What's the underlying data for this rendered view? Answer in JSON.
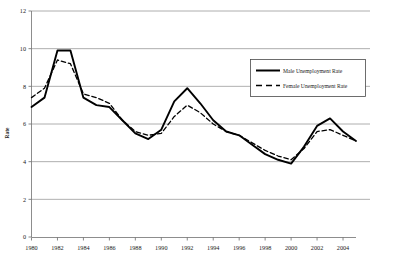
{
  "chart_data": {
    "type": "line",
    "title": "",
    "xlabel": "",
    "ylabel": "Rate",
    "xlim": [
      1980,
      2005
    ],
    "ylim": [
      0,
      12
    ],
    "ytick_step": 2,
    "xtick_step": 2,
    "grid": true,
    "grid_axis": "y",
    "legend_position": "upper-right",
    "x": [
      1980,
      1981,
      1982,
      1983,
      1984,
      1985,
      1986,
      1987,
      1988,
      1989,
      1990,
      1991,
      1992,
      1993,
      1994,
      1995,
      1996,
      1997,
      1998,
      1999,
      2000,
      2001,
      2002,
      2003,
      2004,
      2005
    ],
    "yticks": [
      0,
      2,
      4,
      6,
      8,
      10,
      12
    ],
    "ytick_labels": [
      "0",
      "2",
      "4",
      "6",
      "8",
      "10",
      "12"
    ],
    "xticks": [
      1980,
      1982,
      1984,
      1986,
      1988,
      1990,
      1992,
      1994,
      1996,
      1998,
      2000,
      2002,
      2004
    ],
    "xtick_labels": [
      "1980",
      "1982",
      "1984",
      "1986",
      "1988",
      "1990",
      "1992",
      "1994",
      "1996",
      "1998",
      "2000",
      "2002",
      "2004"
    ],
    "series": [
      {
        "name": "Male Unemployment Rate",
        "style": "solid",
        "color": "#000000",
        "width": 1.9,
        "values": [
          6.9,
          7.4,
          9.9,
          9.9,
          7.4,
          7.0,
          6.9,
          6.2,
          5.5,
          5.2,
          5.7,
          7.2,
          7.9,
          7.1,
          6.2,
          5.6,
          5.4,
          4.9,
          4.4,
          4.1,
          3.9,
          4.8,
          5.9,
          6.3,
          5.6,
          5.1
        ]
      },
      {
        "name": "Female Unemployment Rate",
        "style": "dashed",
        "color": "#000000",
        "width": 1.3,
        "values": [
          7.4,
          7.9,
          9.4,
          9.2,
          7.6,
          7.4,
          7.1,
          6.2,
          5.6,
          5.4,
          5.5,
          6.4,
          7.0,
          6.6,
          6.0,
          5.6,
          5.4,
          5.0,
          4.6,
          4.3,
          4.1,
          4.7,
          5.6,
          5.7,
          5.4,
          5.1
        ]
      }
    ],
    "legend_entries": [
      {
        "label": "Male Unemployment Rate",
        "style": "solid"
      },
      {
        "label": "Female Unemployment Rate",
        "style": "dashed"
      }
    ]
  },
  "axis": {
    "y_title": "Rate"
  }
}
